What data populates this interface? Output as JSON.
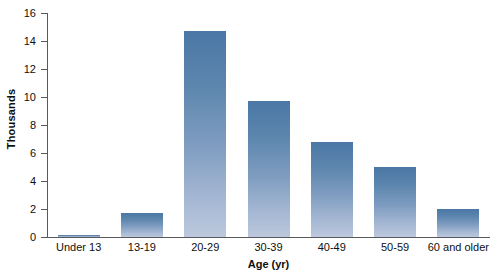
{
  "chart_data": {
    "type": "bar",
    "title": "",
    "xlabel": "Age (yr)",
    "ylabel": "Thousands",
    "categories": [
      "Under 13",
      "13-19",
      "20-29",
      "30-39",
      "40-49",
      "50-59",
      "60 and older"
    ],
    "values": [
      0.15,
      1.7,
      14.7,
      9.7,
      6.8,
      5.0,
      2.0
    ],
    "ylim": [
      0,
      16
    ],
    "yticks": [
      0,
      2,
      4,
      6,
      8,
      10,
      12,
      14,
      16
    ],
    "ytick_labels": [
      "0",
      "2",
      "4",
      "6",
      "8",
      "10",
      "12",
      "14",
      "16"
    ],
    "grid": false,
    "legend": false,
    "legend_position": "none",
    "bar_color_top": "#4a77a5",
    "bar_color_bottom": "#bcc8dd",
    "axis_color": "#59595b",
    "background": "#ffffff"
  }
}
